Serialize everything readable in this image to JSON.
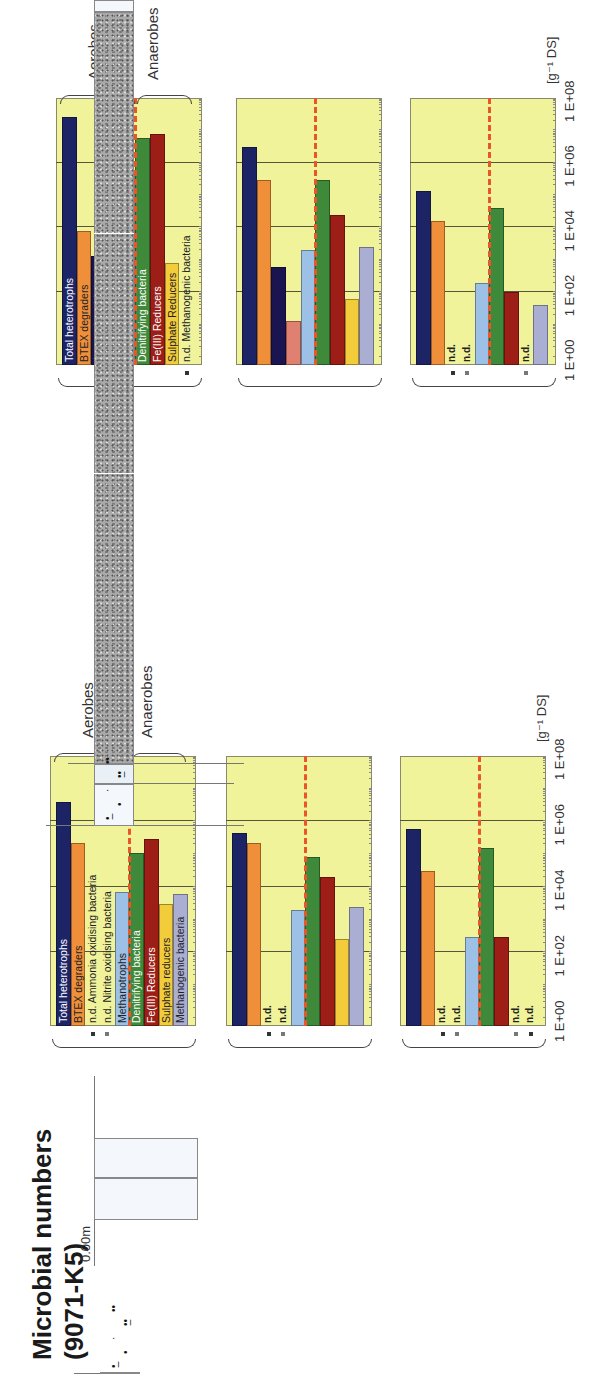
{
  "unit_label": "[g⁻¹ DS]",
  "axis_ticks": [
    "1 E+00",
    "1 E+02",
    "1 E+04",
    "1 E+06",
    "1 E+08"
  ],
  "groups": {
    "aerobes": "Aerobes",
    "anaerobes": "Anaerobes"
  },
  "nd_label": "n.d.",
  "colors": {
    "total_heterotrophs": "#1c2466",
    "btex": "#ef8f3a",
    "ammonia": "#1a1450",
    "nitrite": "#e08070",
    "methanotrophs": "#9dc1e6",
    "denitrifying": "#3f8a3a",
    "fe3": "#9c1e16",
    "sulphate": "#f3cc3c",
    "methanogenic": "#a9aed2",
    "panel_bg": "#f0f39a",
    "divider": "#e8562a"
  },
  "k2": {
    "title_line1": "Microbial numbers",
    "title_line2": "(8970-K2)",
    "depth_top": "0.00m",
    "depth_a": "2.60m",
    "depth_b": "4.40m",
    "layer_silt": "Silt/Clay/Peat",
    "layer_silt2": "sediments",
    "layer_sand": "Sand/gravel",
    "depth_bottom_a": "14.50m",
    "depth_bottom_b": "15.00m",
    "sample1_top": "3.10m",
    "sample1_bottom": "4.40m",
    "sample2": "5.60m",
    "sample3_top": "11.00m",
    "sample3_bottom": "11.50m",
    "labels": [
      "Total heterotrophs",
      "BTEX degraders",
      "Ammonia oxidising bacteria",
      "Nitrite oxidising bacteria",
      "Methanotrophs",
      "Denitrifying bacteria",
      "Fe(III) Reducers",
      "Sulphate Reducers",
      "n.d. Methanogenic bacteria"
    ]
  },
  "k5": {
    "title_line1": "Microbial numbers",
    "title_line2": "(9071-K5)",
    "depth_top": "0.00m",
    "depth_a": "2.10m",
    "depth_b": "3.40m",
    "layer_silt": "Silt/Clay/Peat",
    "layer_silt2": "sediments",
    "layer_sand": "Sand/gravel",
    "depth_bottom": "15.00m",
    "sample1_top": "3.10m",
    "sample1_bottom": "3.40m",
    "sample2_top": "4.00m",
    "sample2_bottom": "4.50m",
    "sample3_top": "11.00m",
    "sample3_bottom": "11.50m",
    "labels": [
      "Total heterotrophs",
      "BTEX degraders",
      "n.d. Ammonia oxidising bacteria",
      "n.d. Nitrite oxidising bacteria",
      "Methanotrophs",
      "Denitrifying bacteria",
      "Fe(III) Reducers",
      "Sulphate reducers",
      "Methanogenic bacteria"
    ]
  },
  "chart_data": [
    {
      "type": "bar",
      "title": "Microbial numbers (8970-K2) — 3.10–4.40m",
      "categories": [
        "Total heterotrophs",
        "BTEX degraders",
        "Ammonia oxidising bacteria",
        "Nitrite oxidising bacteria",
        "Methanotrophs",
        "Denitrifying bacteria",
        "Fe(III) Reducers",
        "Sulphate Reducers",
        "Methanogenic bacteria"
      ],
      "values": [
        25000000,
        8000,
        1300,
        250,
        500000,
        6000000,
        8000000,
        800,
        null
      ],
      "xlabel": "[g-1 DS]",
      "scale": "log",
      "xlim": [
        1,
        100000000
      ],
      "orientation": "horizontal",
      "grid": true
    },
    {
      "type": "bar",
      "title": "Microbial numbers (8970-K2) — 5.60m",
      "categories": [
        "Total heterotrophs",
        "BTEX degraders",
        "Ammonia oxidising bacteria",
        "Nitrite oxidising bacteria",
        "Methanotrophs",
        "Denitrifying bacteria",
        "Fe(III) Reducers",
        "Sulphate Reducers",
        "Methanogenic bacteria"
      ],
      "values": [
        3000000,
        300000,
        600,
        13,
        2000,
        300000,
        25000,
        60,
        2500
      ],
      "xlabel": "[g-1 DS]",
      "scale": "log",
      "xlim": [
        1,
        100000000
      ],
      "orientation": "horizontal",
      "grid": true
    },
    {
      "type": "bar",
      "title": "Microbial numbers (8970-K2) — 11.00–11.50m",
      "categories": [
        "Total heterotrophs",
        "BTEX degraders",
        "Ammonia oxidising bacteria",
        "Nitrite oxidising bacteria",
        "Methanotrophs",
        "Denitrifying bacteria",
        "Fe(III) Reducers",
        "Sulphate Reducers",
        "Methanogenic bacteria"
      ],
      "values": [
        130000,
        16000,
        null,
        null,
        200,
        40000,
        100,
        null,
        40
      ],
      "xlabel": "[g-1 DS]",
      "scale": "log",
      "xlim": [
        1,
        100000000
      ],
      "orientation": "horizontal",
      "grid": true
    },
    {
      "type": "bar",
      "title": "Microbial numbers (9071-K5) — 3.10–3.40m",
      "categories": [
        "Total heterotrophs",
        "BTEX degraders",
        "Ammonia oxidising bacteria",
        "Nitrite oxidising bacteria",
        "Methanotrophs",
        "Denitrifying bacteria",
        "Fe(III) Reducers",
        "Sulphate reducers",
        "Methanogenic bacteria"
      ],
      "values": [
        4000000,
        220000,
        null,
        null,
        7000,
        110000,
        300000,
        3000,
        6000
      ],
      "xlabel": "[g-1 DS]",
      "scale": "log",
      "xlim": [
        1,
        100000000
      ],
      "orientation": "horizontal",
      "grid": true
    },
    {
      "type": "bar",
      "title": "Microbial numbers (9071-K5) — 4.00–4.50m",
      "categories": [
        "Total heterotrophs",
        "BTEX degraders",
        "Ammonia oxidising bacteria",
        "Nitrite oxidising bacteria",
        "Methanotrophs",
        "Denitrifying bacteria",
        "Fe(III) Reducers",
        "Sulphate reducers",
        "Methanogenic bacteria"
      ],
      "values": [
        450000,
        220000,
        null,
        null,
        2000,
        80000,
        20000,
        250,
        2500
      ],
      "xlabel": "[g-1 DS]",
      "scale": "log",
      "xlim": [
        1,
        100000000
      ],
      "orientation": "horizontal",
      "grid": true
    },
    {
      "type": "bar",
      "title": "Microbial numbers (9071-K5) — 11.00–11.50m",
      "categories": [
        "Total heterotrophs",
        "BTEX degraders",
        "Ammonia oxidising bacteria",
        "Nitrite oxidising bacteria",
        "Methanotrophs",
        "Denitrifying bacteria",
        "Fe(III) Reducers",
        "Sulphate reducers",
        "Methanogenic bacteria"
      ],
      "values": [
        600000,
        30000,
        null,
        null,
        300,
        160000,
        300,
        null,
        null
      ],
      "xlabel": "[g-1 DS]",
      "scale": "log",
      "xlim": [
        1,
        100000000
      ],
      "orientation": "horizontal",
      "grid": true
    }
  ]
}
